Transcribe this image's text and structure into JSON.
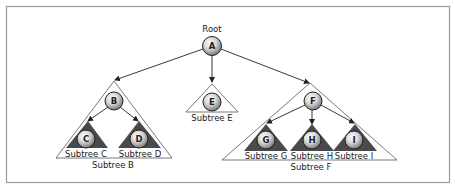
{
  "diagram": {
    "title_label": "Root",
    "colors": {
      "frame": "#9a9a9a",
      "edge": "#222222",
      "outline_triangle": "#555555",
      "filled_triangle": "#4a4a4a",
      "node_fill_light": "#f4f4f4",
      "node_fill_dark": "#7a7a7a",
      "node_stroke": "#222222"
    },
    "nodes": [
      {
        "id": "A",
        "label": "A",
        "x": 212,
        "y": 46
      },
      {
        "id": "B",
        "label": "B",
        "x": 114,
        "y": 101
      },
      {
        "id": "C",
        "label": "C",
        "x": 86,
        "y": 139
      },
      {
        "id": "D",
        "label": "D",
        "x": 139,
        "y": 139
      },
      {
        "id": "E",
        "label": "E",
        "x": 212,
        "y": 102
      },
      {
        "id": "F",
        "label": "F",
        "x": 313,
        "y": 101
      },
      {
        "id": "G",
        "label": "G",
        "x": 266,
        "y": 140
      },
      {
        "id": "H",
        "label": "H",
        "x": 312,
        "y": 140
      },
      {
        "id": "I",
        "label": "I",
        "x": 354,
        "y": 140
      }
    ],
    "edges": [
      {
        "from": "A",
        "to": "B"
      },
      {
        "from": "A",
        "to": "E"
      },
      {
        "from": "A",
        "to": "F"
      },
      {
        "from": "B",
        "to": "C"
      },
      {
        "from": "B",
        "to": "D"
      },
      {
        "from": "F",
        "to": "G"
      },
      {
        "from": "F",
        "to": "H"
      },
      {
        "from": "F",
        "to": "I"
      }
    ],
    "subtrees": {
      "B": {
        "label": "Subtree B",
        "style": "outline"
      },
      "C": {
        "label": "Subtree C",
        "style": "filled"
      },
      "D": {
        "label": "Subtree D",
        "style": "filled"
      },
      "E": {
        "label": "Subtree E",
        "style": "outline"
      },
      "F": {
        "label": "Subtree F",
        "style": "outline"
      },
      "G": {
        "label": "Subtree G",
        "style": "filled"
      },
      "H": {
        "label": "Subtree H",
        "style": "filled"
      },
      "I": {
        "label": "Subtree I",
        "style": "filled"
      }
    }
  }
}
